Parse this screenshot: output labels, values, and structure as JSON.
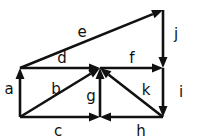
{
  "diagram": {
    "type": "directed-graph",
    "canvas": {
      "width": 197,
      "height": 139
    },
    "colors": {
      "background": "#ffffff",
      "stroke": "#111111",
      "label": "#111111"
    },
    "nodes": [
      {
        "id": "TL",
        "name": "top-left-node",
        "x": 20,
        "y": 68
      },
      {
        "id": "BL",
        "name": "bottom-left-node",
        "x": 20,
        "y": 117
      },
      {
        "id": "C",
        "name": "center-node",
        "x": 100,
        "y": 68
      },
      {
        "id": "BC",
        "name": "bottom-center-node",
        "x": 100,
        "y": 117
      },
      {
        "id": "R",
        "name": "right-node",
        "x": 163,
        "y": 68
      },
      {
        "id": "BR",
        "name": "bottom-right-node",
        "x": 163,
        "y": 117
      },
      {
        "id": "AP",
        "name": "apex-node",
        "x": 163,
        "y": 10
      }
    ],
    "edges": [
      {
        "label": "a",
        "from": "BL",
        "to": "TL",
        "label_x": 9,
        "label_y": 89,
        "direction": "up"
      },
      {
        "label": "b",
        "from": "BL",
        "to": "C",
        "label_x": 56,
        "label_y": 89,
        "direction": "up-right"
      },
      {
        "label": "c",
        "from": "BL",
        "to": "BC",
        "label_x": 58,
        "label_y": 131,
        "direction": "right"
      },
      {
        "label": "d",
        "from": "TL",
        "to": "C",
        "label_x": 62,
        "label_y": 58,
        "direction": "right"
      },
      {
        "label": "e",
        "from": "TL",
        "to": "AP",
        "label_x": 82,
        "label_y": 32,
        "direction": "up-right"
      },
      {
        "label": "f",
        "from": "C",
        "to": "R",
        "label_x": 132,
        "label_y": 58,
        "direction": "right"
      },
      {
        "label": "g",
        "from": "BC",
        "to": "C",
        "label_x": 91,
        "label_y": 96,
        "direction": "up"
      },
      {
        "label": "h",
        "from": "BR",
        "to": "BC",
        "label_x": 141,
        "label_y": 131,
        "direction": "left"
      },
      {
        "label": "i",
        "from": "R",
        "to": "BR",
        "label_x": 181,
        "label_y": 92,
        "direction": "down"
      },
      {
        "label": "j",
        "from": "AP",
        "to": "R",
        "label_x": 176,
        "label_y": 34,
        "direction": "down-right"
      },
      {
        "label": "k",
        "from": "BR",
        "to": "C",
        "label_x": 146,
        "label_y": 90,
        "direction": "up-left"
      }
    ]
  }
}
